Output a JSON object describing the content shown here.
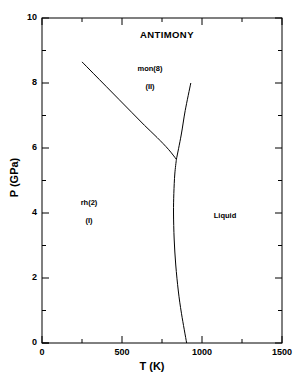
{
  "chart_data": {
    "type": "line",
    "title": "ANTIMONY",
    "xlabel": "T (K)",
    "ylabel": "P (GPa)",
    "xlim": [
      0,
      1500
    ],
    "ylim": [
      0,
      10
    ],
    "xticks": [
      0,
      500,
      1000,
      1500
    ],
    "yticks": [
      0,
      2,
      4,
      6,
      8,
      10
    ],
    "xtick_labels": [
      "0",
      "500",
      "1000",
      "1500"
    ],
    "ytick_labels": [
      "0",
      "2",
      "4",
      "6",
      "8",
      "10"
    ],
    "x_minor_ticks": [
      250,
      750,
      1250
    ],
    "y_minor_ticks": [
      1,
      3,
      5,
      7,
      9
    ],
    "grid": false,
    "legend": "none",
    "triple_point": {
      "T": 840,
      "P": 5.65
    },
    "series": [
      {
        "name": "rh(2)-mon(8) boundary",
        "comment": "solid-solid transition line, I to II",
        "points": [
          [
            250,
            8.65
          ],
          [
            320,
            8.3
          ],
          [
            400,
            7.9
          ],
          [
            480,
            7.5
          ],
          [
            560,
            7.1
          ],
          [
            640,
            6.7
          ],
          [
            720,
            6.32
          ],
          [
            790,
            5.96
          ],
          [
            840,
            5.65
          ]
        ]
      },
      {
        "name": "mon(8)-liquid boundary",
        "comment": "melting curve of phase II above the triple point",
        "points": [
          [
            840,
            5.65
          ],
          [
            870,
            6.4
          ],
          [
            895,
            7.15
          ],
          [
            930,
            8.0
          ]
        ]
      },
      {
        "name": "rh(2)-liquid melting curve",
        "comment": "melting curve of phase I below the triple point",
        "points": [
          [
            840,
            5.65
          ],
          [
            830,
            5.2
          ],
          [
            824,
            4.6
          ],
          [
            822,
            4.0
          ],
          [
            826,
            3.2
          ],
          [
            836,
            2.4
          ],
          [
            852,
            1.6
          ],
          [
            872,
            0.9
          ],
          [
            904,
            0.0
          ]
        ]
      }
    ],
    "annotations": [
      {
        "name": "phase-label-mon",
        "text": "mon(8)",
        "T": 660,
        "P": 8.3
      },
      {
        "name": "phase-label-mon-roman",
        "text": "(II)",
        "T": 660,
        "P": 7.72
      },
      {
        "name": "phase-label-rh",
        "text": "rh(2)",
        "T": 290,
        "P": 4.18
      },
      {
        "name": "phase-label-rh-roman",
        "text": "(I)",
        "T": 290,
        "P": 3.62
      },
      {
        "name": "phase-label-liquid",
        "text": "Liquid",
        "T": 1180,
        "P": 4.0
      }
    ],
    "colors": {
      "axis": "#000000",
      "line": "#000000",
      "background": "#ffffff"
    }
  },
  "chart": {
    "title": "ANTIMONY",
    "xaxis_title": "T (K)",
    "yaxis_title": "P (GPa)",
    "xticks": [
      "0",
      "500",
      "1000",
      "1500"
    ],
    "yticks": [
      "0",
      "2",
      "4",
      "6",
      "8",
      "10"
    ],
    "regions": {
      "mon_name": "mon(8)",
      "mon_roman": "(II)",
      "rh_name": "rh(2)",
      "rh_roman": "(I)",
      "liquid": "Liquid"
    }
  }
}
